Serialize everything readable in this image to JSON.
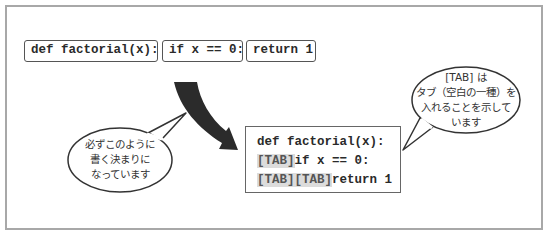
{
  "top_row": {
    "chips": [
      {
        "text": "def factorial(x):"
      },
      {
        "text": "if x == 0:"
      },
      {
        "text": "return 1"
      }
    ]
  },
  "code_block": {
    "lines": [
      {
        "tabs": [],
        "code": "def factorial(x):"
      },
      {
        "tabs": [
          "[TAB]"
        ],
        "code": "if x == 0:"
      },
      {
        "tabs": [
          "[TAB]",
          "[TAB]"
        ],
        "code": "return 1"
      }
    ]
  },
  "callouts": {
    "left": {
      "lines": [
        "必ずこのように",
        "書く決まりに",
        "なっています"
      ]
    },
    "right": {
      "lines": [
        "[TAB] は",
        "タブ（空白の一種）を",
        "入れることを示して",
        "います"
      ]
    }
  },
  "arrow": {
    "icon": "curved-arrow-icon",
    "color": "#2b2b2b"
  },
  "colors": {
    "frame": "#a8a8a8",
    "tab_highlight": "#dcdcdc",
    "text": "#2a2a2a"
  }
}
